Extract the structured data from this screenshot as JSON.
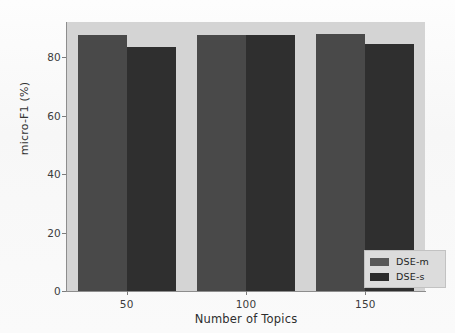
{
  "chart_data": {
    "type": "bar",
    "title": "",
    "xlabel": "Number of Topics",
    "ylabel": "micro-F1 (%)",
    "categories": [
      "50",
      "100",
      "150"
    ],
    "series": [
      {
        "name": "DSE-m",
        "values": [
          87.5,
          87.5,
          88.0
        ],
        "color": "#494949"
      },
      {
        "name": "DSE-s",
        "values": [
          83.5,
          87.5,
          84.5
        ],
        "color": "#2f2f2f"
      }
    ],
    "ylim": [
      0,
      92
    ],
    "yticks": [
      0,
      20,
      40,
      60,
      80
    ],
    "ytick_labels": [
      "0",
      "20",
      "40",
      "60",
      "80"
    ],
    "xtick_labels": [
      "50",
      "100",
      "150"
    ],
    "grid": false,
    "legend_position": "lower-right",
    "plot_background": "#d4d4d4",
    "figure_background": "#ffffff"
  },
  "axes": {
    "y_label": "micro-F1 (%)",
    "x_label": "Number of Topics",
    "y_ticks": [
      "80",
      "60",
      "40",
      "20",
      "0"
    ],
    "x_ticks": [
      "50",
      "100",
      "150"
    ]
  },
  "legend": {
    "items": [
      {
        "label": "DSE-m",
        "color": "#585858"
      },
      {
        "label": "DSE-s",
        "color": "#2b2b2b"
      }
    ]
  },
  "artifacts": {
    "ghost_top": "",
    "ghost_bottom": ""
  }
}
